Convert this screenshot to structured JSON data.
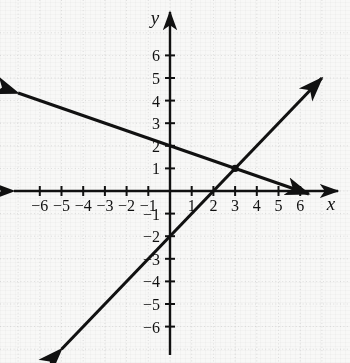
{
  "chart_data": {
    "type": "line",
    "title": "",
    "xlabel": "x",
    "ylabel": "y",
    "xlim": [
      -7,
      7
    ],
    "ylim": [
      -7,
      7
    ],
    "grid": true,
    "grid_style": "dotted",
    "legend": "none",
    "axis_labels": {
      "x": "x",
      "y": "y"
    },
    "xticks": [
      -6,
      -5,
      -4,
      -3,
      -2,
      -1,
      1,
      2,
      3,
      4,
      5,
      6
    ],
    "xticklabels": [
      "−6",
      "−5",
      "−4",
      "−3",
      "−2",
      "−1",
      "1",
      "2",
      "3",
      "4",
      "5",
      "6"
    ],
    "yticks": [
      -6,
      -5,
      -4,
      -3,
      -2,
      -1,
      1,
      2,
      3,
      4,
      5,
      6
    ],
    "yticklabels": [
      "−6",
      "−5",
      "−4",
      "−3",
      "−2",
      "−1",
      "1",
      "2",
      "3",
      "4",
      "5",
      "6"
    ],
    "series": [
      {
        "name": "rising-line",
        "equation": "y = x - 2",
        "slope": 1,
        "y_intercept": -2,
        "x_intercept": 2,
        "color": "#111111",
        "arrows": "both",
        "points": [
          [
            -5,
            -7
          ],
          [
            7,
            5
          ]
        ]
      },
      {
        "name": "falling-line",
        "equation": "y = -x/3 + 2",
        "slope": -0.3333,
        "y_intercept": 2,
        "x_intercept": 6,
        "color": "#111111",
        "arrows": "both",
        "points": [
          [
            -7,
            4.333
          ],
          [
            6.4,
            -0.133
          ]
        ]
      }
    ],
    "annotations": [
      {
        "name": "intersection-point",
        "x": 3,
        "y": 1,
        "label": "",
        "marker": "filled-dot"
      }
    ],
    "colors": {
      "axis": "#111111",
      "grid": "#c9c9c9",
      "line": "#111111",
      "background": "#f8f8f7",
      "text": "#111111"
    },
    "geometry": {
      "origin_x": 170,
      "origin_y": 191,
      "unit_x": 21.7,
      "unit_y": 22.6
    }
  }
}
